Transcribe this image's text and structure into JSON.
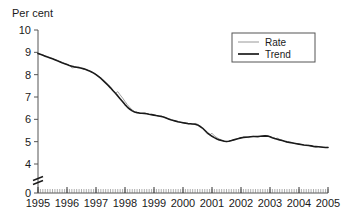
{
  "axis": {
    "y_title": "Per cent",
    "y_ticks": [
      "0",
      "4",
      "5",
      "6",
      "7",
      "8",
      "9",
      "10"
    ],
    "y_break_marker": "axis-break",
    "x_ticks": [
      "1995",
      "1996",
      "1997",
      "1998",
      "1999",
      "2000",
      "2001",
      "2002",
      "2003",
      "2004",
      "2005"
    ]
  },
  "legend": {
    "items": [
      {
        "label": "Rate",
        "color": "#8c8c8c"
      },
      {
        "label": "Trend",
        "color": "#1a1a1a"
      }
    ]
  },
  "chart_data": {
    "type": "line",
    "title": "",
    "subtitle": "",
    "xlabel": "",
    "ylabel": "Per cent",
    "ylim": [
      4,
      10
    ],
    "y_axis_break": [
      0,
      4
    ],
    "xlim": [
      1995,
      2005
    ],
    "grid": false,
    "legend_position": "top-right",
    "x_tick_labels": [
      "1995",
      "1996",
      "1997",
      "1998",
      "1999",
      "2000",
      "2001",
      "2002",
      "2003",
      "2004",
      "2005"
    ],
    "y_tick_labels": [
      "0",
      "4",
      "5",
      "6",
      "7",
      "8",
      "9",
      "10"
    ],
    "x_minor_ticks": "monthly",
    "series": [
      {
        "name": "Rate",
        "color": "#8c8c8c",
        "width": 0.8,
        "x": [
          1995.0,
          1995.08,
          1995.17,
          1995.25,
          1995.33,
          1995.42,
          1995.5,
          1995.58,
          1995.67,
          1995.75,
          1995.83,
          1995.92,
          1996.0,
          1996.08,
          1996.17,
          1996.25,
          1996.33,
          1996.42,
          1996.5,
          1996.58,
          1996.67,
          1996.75,
          1996.83,
          1996.92,
          1997.0,
          1997.08,
          1997.17,
          1997.25,
          1997.33,
          1997.42,
          1997.5,
          1997.58,
          1997.67,
          1997.75,
          1997.83,
          1997.92,
          1998.0,
          1998.08,
          1998.17,
          1998.25,
          1998.33,
          1998.42,
          1998.5,
          1998.58,
          1998.67,
          1998.75,
          1998.83,
          1998.92,
          1999.0,
          1999.08,
          1999.17,
          1999.25,
          1999.33,
          1999.42,
          1999.5,
          1999.58,
          1999.67,
          1999.75,
          1999.83,
          1999.92,
          2000.0,
          2000.08,
          2000.17,
          2000.25,
          2000.33,
          2000.42,
          2000.5,
          2000.58,
          2000.67,
          2000.75,
          2000.83,
          2000.92,
          2001.0,
          2001.08,
          2001.17,
          2001.25,
          2001.33,
          2001.42,
          2001.5,
          2001.58,
          2001.67,
          2001.75,
          2001.83,
          2001.92,
          2002.0,
          2002.08,
          2002.17,
          2002.25,
          2002.33,
          2002.42,
          2002.5,
          2002.58,
          2002.67,
          2002.75,
          2002.83,
          2002.92,
          2003.0,
          2003.08,
          2003.17,
          2003.25,
          2003.33,
          2003.42,
          2003.5,
          2003.58,
          2003.67,
          2003.75,
          2003.83,
          2003.92,
          2004.0,
          2004.08,
          2004.17,
          2004.25,
          2004.33,
          2004.42,
          2004.5,
          2004.58,
          2004.67,
          2004.75,
          2004.83,
          2004.92,
          2005.0
        ],
        "y": [
          8.95,
          8.92,
          8.88,
          8.84,
          8.8,
          8.76,
          8.72,
          8.68,
          8.63,
          8.58,
          8.54,
          8.5,
          8.46,
          8.42,
          8.3,
          8.32,
          8.36,
          8.34,
          8.3,
          8.26,
          8.22,
          8.18,
          8.14,
          8.08,
          8.02,
          7.94,
          7.86,
          7.76,
          7.66,
          7.55,
          7.44,
          7.32,
          7.16,
          7.24,
          7.1,
          6.95,
          6.8,
          6.66,
          6.52,
          6.42,
          6.34,
          6.3,
          6.28,
          6.26,
          6.3,
          6.26,
          6.22,
          6.2,
          6.18,
          6.16,
          6.12,
          6.16,
          6.1,
          6.06,
          6.02,
          5.98,
          5.94,
          5.92,
          5.88,
          5.86,
          5.84,
          5.82,
          5.8,
          5.8,
          5.78,
          5.82,
          5.78,
          5.7,
          5.6,
          5.48,
          5.36,
          5.3,
          5.38,
          5.26,
          5.18,
          5.12,
          5.08,
          5.04,
          5.0,
          5.02,
          5.04,
          5.08,
          5.12,
          5.16,
          5.18,
          5.2,
          5.22,
          5.18,
          5.22,
          5.24,
          5.22,
          5.2,
          5.24,
          5.26,
          5.28,
          5.26,
          5.22,
          5.18,
          5.12,
          5.16,
          5.1,
          5.06,
          5.02,
          4.98,
          4.96,
          4.94,
          4.92,
          4.9,
          4.88,
          4.86,
          4.84,
          4.82,
          4.84,
          4.8,
          4.78,
          4.76,
          4.78,
          4.76,
          4.74,
          4.74,
          4.75
        ]
      },
      {
        "name": "Trend",
        "color": "#1a1a1a",
        "width": 1.6,
        "x": [
          1995.0,
          1995.08,
          1995.17,
          1995.25,
          1995.33,
          1995.42,
          1995.5,
          1995.58,
          1995.67,
          1995.75,
          1995.83,
          1995.92,
          1996.0,
          1996.08,
          1996.17,
          1996.25,
          1996.33,
          1996.42,
          1996.5,
          1996.58,
          1996.67,
          1996.75,
          1996.83,
          1996.92,
          1997.0,
          1997.08,
          1997.17,
          1997.25,
          1997.33,
          1997.42,
          1997.5,
          1997.58,
          1997.67,
          1997.75,
          1997.83,
          1997.92,
          1998.0,
          1998.08,
          1998.17,
          1998.25,
          1998.33,
          1998.42,
          1998.5,
          1998.58,
          1998.67,
          1998.75,
          1998.83,
          1998.92,
          1999.0,
          1999.08,
          1999.17,
          1999.25,
          1999.33,
          1999.42,
          1999.5,
          1999.58,
          1999.67,
          1999.75,
          1999.83,
          1999.92,
          2000.0,
          2000.08,
          2000.17,
          2000.25,
          2000.33,
          2000.42,
          2000.5,
          2000.58,
          2000.67,
          2000.75,
          2000.83,
          2000.92,
          2001.0,
          2001.08,
          2001.17,
          2001.25,
          2001.33,
          2001.42,
          2001.5,
          2001.58,
          2001.67,
          2001.75,
          2001.83,
          2001.92,
          2002.0,
          2002.08,
          2002.17,
          2002.25,
          2002.33,
          2002.42,
          2002.5,
          2002.58,
          2002.67,
          2002.75,
          2002.83,
          2002.92,
          2003.0,
          2003.08,
          2003.17,
          2003.25,
          2003.33,
          2003.42,
          2003.5,
          2003.58,
          2003.67,
          2003.75,
          2003.83,
          2003.92,
          2004.0,
          2004.08,
          2004.17,
          2004.25,
          2004.33,
          2004.42,
          2004.5,
          2004.58,
          2004.67,
          2004.75,
          2004.83,
          2004.92,
          2005.0
        ],
        "y": [
          8.95,
          8.91,
          8.87,
          8.83,
          8.79,
          8.75,
          8.71,
          8.67,
          8.62,
          8.58,
          8.53,
          8.49,
          8.45,
          8.41,
          8.38,
          8.35,
          8.33,
          8.31,
          8.29,
          8.26,
          8.22,
          8.18,
          8.13,
          8.07,
          8.0,
          7.92,
          7.83,
          7.73,
          7.63,
          7.52,
          7.41,
          7.29,
          7.17,
          7.05,
          6.92,
          6.79,
          6.66,
          6.55,
          6.45,
          6.38,
          6.33,
          6.3,
          6.28,
          6.27,
          6.26,
          6.25,
          6.23,
          6.21,
          6.19,
          6.17,
          6.15,
          6.13,
          6.1,
          6.06,
          6.02,
          5.98,
          5.95,
          5.92,
          5.89,
          5.87,
          5.85,
          5.83,
          5.81,
          5.8,
          5.79,
          5.78,
          5.75,
          5.69,
          5.61,
          5.51,
          5.41,
          5.32,
          5.24,
          5.18,
          5.12,
          5.08,
          5.05,
          5.02,
          5.01,
          5.02,
          5.05,
          5.08,
          5.11,
          5.14,
          5.17,
          5.19,
          5.2,
          5.21,
          5.22,
          5.23,
          5.23,
          5.23,
          5.24,
          5.25,
          5.26,
          5.25,
          5.22,
          5.18,
          5.14,
          5.11,
          5.08,
          5.05,
          5.02,
          4.99,
          4.97,
          4.95,
          4.93,
          4.91,
          4.89,
          4.87,
          4.85,
          4.84,
          4.83,
          4.81,
          4.79,
          4.78,
          4.77,
          4.76,
          4.75,
          4.74,
          4.74
        ]
      }
    ]
  }
}
